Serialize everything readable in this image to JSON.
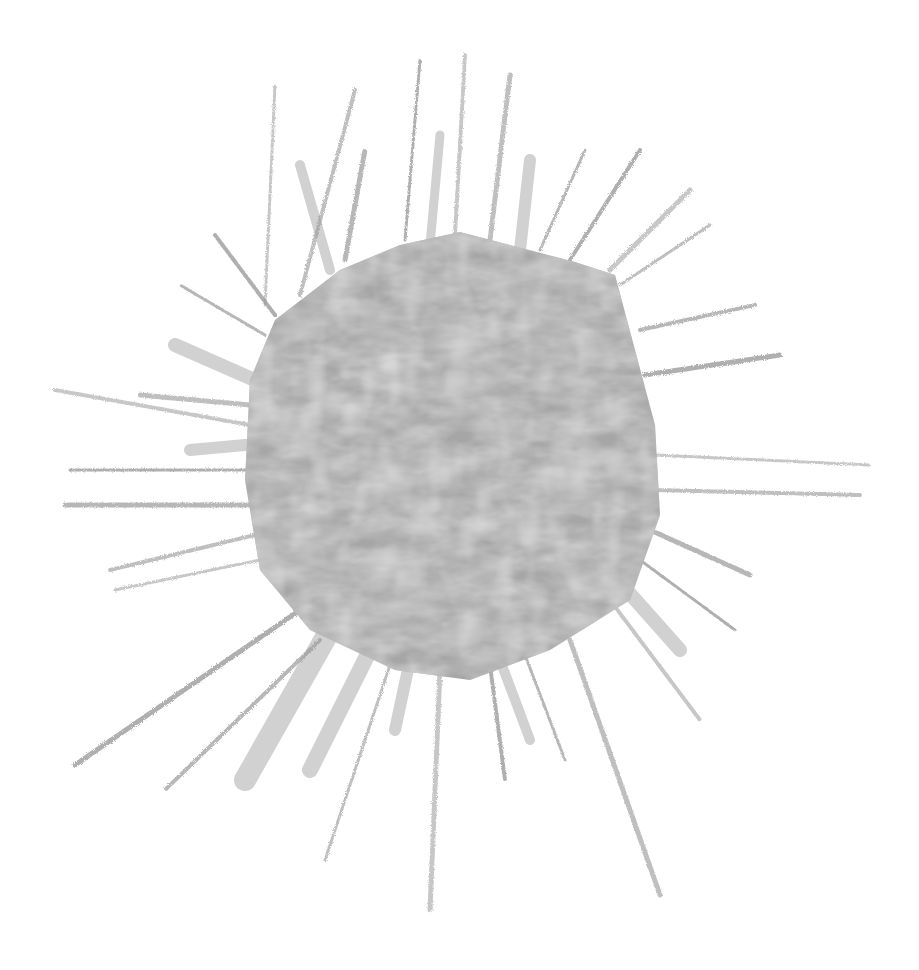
{
  "artwork": {
    "subject": "collage sun / starburst illustration",
    "background_color": "#ffffff",
    "polygon": {
      "fill_base": "#a6a6a6",
      "fill_dark": "#8f8f8f",
      "fill_light": "#c8c8c8",
      "points": "400,245 460,232 575,262 615,275 635,350 655,425 660,515 630,600 550,650 470,680 395,670 310,630 260,570 245,480 250,380 275,320 340,270"
    },
    "rays": {
      "pencil_color": "#9a9a9a",
      "broad_color": "#c9c9c9",
      "pencil": [
        {
          "x1": 265,
          "y1": 305,
          "x2": 275,
          "y2": 85
        },
        {
          "x1": 300,
          "y1": 295,
          "x2": 355,
          "y2": 90
        },
        {
          "x1": 345,
          "y1": 260,
          "x2": 365,
          "y2": 150
        },
        {
          "x1": 405,
          "y1": 240,
          "x2": 420,
          "y2": 60
        },
        {
          "x1": 455,
          "y1": 235,
          "x2": 465,
          "y2": 55
        },
        {
          "x1": 490,
          "y1": 240,
          "x2": 510,
          "y2": 75
        },
        {
          "x1": 540,
          "y1": 250,
          "x2": 585,
          "y2": 150
        },
        {
          "x1": 570,
          "y1": 260,
          "x2": 640,
          "y2": 150
        },
        {
          "x1": 610,
          "y1": 270,
          "x2": 690,
          "y2": 190
        },
        {
          "x1": 620,
          "y1": 285,
          "x2": 710,
          "y2": 225
        },
        {
          "x1": 640,
          "y1": 330,
          "x2": 755,
          "y2": 305
        },
        {
          "x1": 645,
          "y1": 375,
          "x2": 780,
          "y2": 355
        },
        {
          "x1": 655,
          "y1": 455,
          "x2": 870,
          "y2": 465
        },
        {
          "x1": 655,
          "y1": 490,
          "x2": 860,
          "y2": 495
        },
        {
          "x1": 650,
          "y1": 530,
          "x2": 750,
          "y2": 575
        },
        {
          "x1": 640,
          "y1": 560,
          "x2": 735,
          "y2": 630
        },
        {
          "x1": 610,
          "y1": 600,
          "x2": 700,
          "y2": 720
        },
        {
          "x1": 570,
          "y1": 640,
          "x2": 660,
          "y2": 895
        },
        {
          "x1": 525,
          "y1": 655,
          "x2": 565,
          "y2": 760
        },
        {
          "x1": 490,
          "y1": 665,
          "x2": 505,
          "y2": 780
        },
        {
          "x1": 440,
          "y1": 670,
          "x2": 430,
          "y2": 910
        },
        {
          "x1": 390,
          "y1": 665,
          "x2": 325,
          "y2": 860
        },
        {
          "x1": 320,
          "y1": 640,
          "x2": 165,
          "y2": 790
        },
        {
          "x1": 300,
          "y1": 610,
          "x2": 75,
          "y2": 765
        },
        {
          "x1": 260,
          "y1": 560,
          "x2": 115,
          "y2": 590
        },
        {
          "x1": 255,
          "y1": 535,
          "x2": 110,
          "y2": 570
        },
        {
          "x1": 250,
          "y1": 505,
          "x2": 65,
          "y2": 505
        },
        {
          "x1": 250,
          "y1": 470,
          "x2": 70,
          "y2": 470
        },
        {
          "x1": 250,
          "y1": 425,
          "x2": 55,
          "y2": 390
        },
        {
          "x1": 250,
          "y1": 405,
          "x2": 140,
          "y2": 395
        },
        {
          "x1": 265,
          "y1": 335,
          "x2": 180,
          "y2": 285
        },
        {
          "x1": 275,
          "y1": 315,
          "x2": 215,
          "y2": 235
        }
      ],
      "broad": [
        {
          "x1": 300,
          "y1": 400,
          "x2": 175,
          "y2": 345,
          "w": 14
        },
        {
          "x1": 300,
          "y1": 440,
          "x2": 190,
          "y2": 450,
          "w": 12
        },
        {
          "x1": 330,
          "y1": 270,
          "x2": 300,
          "y2": 165,
          "w": 10
        },
        {
          "x1": 430,
          "y1": 245,
          "x2": 440,
          "y2": 135,
          "w": 9
        },
        {
          "x1": 520,
          "y1": 250,
          "x2": 530,
          "y2": 160,
          "w": 12
        },
        {
          "x1": 600,
          "y1": 560,
          "x2": 680,
          "y2": 650,
          "w": 14
        },
        {
          "x1": 330,
          "y1": 630,
          "x2": 245,
          "y2": 780,
          "w": 22
        },
        {
          "x1": 370,
          "y1": 650,
          "x2": 310,
          "y2": 770,
          "w": 16
        },
        {
          "x1": 410,
          "y1": 660,
          "x2": 395,
          "y2": 730,
          "w": 12
        },
        {
          "x1": 500,
          "y1": 660,
          "x2": 530,
          "y2": 740,
          "w": 10
        }
      ]
    }
  }
}
